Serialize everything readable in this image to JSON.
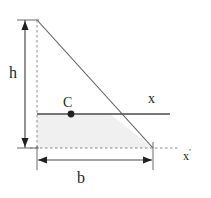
{
  "figure": {
    "type": "geometry-diagram",
    "labels": {
      "height": "h",
      "base": "b",
      "centroid": "C",
      "axis_x": "x",
      "axis_x_prime": "x",
      "axis_x_prime_mark": "′"
    },
    "colors": {
      "stroke": "#231f20",
      "fill": "#f0f0f0",
      "background": "#ffffff"
    },
    "geometry": {
      "apex": [
        37,
        20
      ],
      "bottom_left": [
        37,
        148
      ],
      "bottom_right": [
        153,
        148
      ],
      "centroid_point": [
        71,
        114
      ],
      "centroid_axis_y": 114,
      "centroid_axis_x_start": 37,
      "centroid_axis_x_end": 170,
      "base_axis_y": 148,
      "base_axis_x_end": 178,
      "h_dimension_x": 25,
      "h_dimension_top": 20,
      "h_dimension_bottom": 148,
      "b_dimension_y": 160,
      "b_dimension_left": 38,
      "b_dimension_right": 152
    }
  }
}
